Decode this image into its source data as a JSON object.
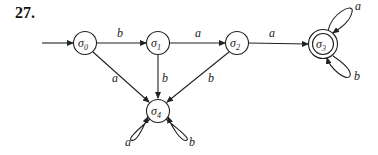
{
  "problem_number": "27.",
  "states": [
    {
      "id": "s0",
      "name": "σ",
      "sub": "0",
      "x": 85,
      "y": 43,
      "start": true,
      "accepting": false
    },
    {
      "id": "s1",
      "name": "σ",
      "sub": "1",
      "x": 158,
      "y": 43,
      "start": false,
      "accepting": false
    },
    {
      "id": "s2",
      "name": "σ",
      "sub": "2",
      "x": 237,
      "y": 43,
      "start": false,
      "accepting": false
    },
    {
      "id": "s3",
      "name": "σ",
      "sub": "3",
      "x": 323,
      "y": 44,
      "start": false,
      "accepting": true
    },
    {
      "id": "s4",
      "name": "σ",
      "sub": "4",
      "x": 158,
      "y": 111,
      "start": false,
      "accepting": false
    }
  ],
  "transitions": [
    {
      "from": "s0",
      "to": "s1",
      "label": "b"
    },
    {
      "from": "s1",
      "to": "s2",
      "label": "a"
    },
    {
      "from": "s2",
      "to": "s3",
      "label": "a"
    },
    {
      "from": "s0",
      "to": "s4",
      "label": "a"
    },
    {
      "from": "s1",
      "to": "s4",
      "label": "b"
    },
    {
      "from": "s2",
      "to": "s4",
      "label": "b"
    },
    {
      "from": "s3",
      "to": "s3",
      "label": "a"
    },
    {
      "from": "s3",
      "to": "s3",
      "label": "b"
    },
    {
      "from": "s4",
      "to": "s4",
      "label": "a"
    },
    {
      "from": "s4",
      "to": "s4",
      "label": "b"
    }
  ],
  "labels": {
    "e01": "b",
    "e12": "a",
    "e23": "a",
    "e04": "a",
    "e14": "b",
    "e24": "b",
    "loop3a": "a",
    "loop3b": "b",
    "loop4a": "a",
    "loop4b": "b"
  }
}
